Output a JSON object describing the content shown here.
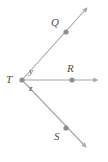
{
  "figure": {
    "type": "geometry-diagram",
    "background_color": "#ffffff",
    "line_color": "#a0a0a0",
    "point_color": "#8c8c8c",
    "label_color": "#4c4c4c",
    "vertex": {
      "name": "T",
      "label": "T",
      "x": 22,
      "y": 80
    },
    "rays": [
      {
        "name": "ray-TQ",
        "from": "T",
        "through": "Q",
        "x1": 22,
        "y1": 80,
        "x2": 88,
        "y2": 7,
        "end_marker": "arrowhead"
      },
      {
        "name": "ray-TR",
        "from": "T",
        "through": "R",
        "x1": 22,
        "y1": 80,
        "x2": 99,
        "y2": 80,
        "end_marker": "arrowhead"
      },
      {
        "name": "ray-TS",
        "from": "T",
        "through": "S",
        "x1": 22,
        "y1": 80,
        "x2": 87,
        "y2": 148,
        "end_marker": "arrowhead"
      }
    ],
    "points": [
      {
        "name": "Q",
        "label": "Q",
        "x": 66,
        "y": 32,
        "label_x": 51,
        "label_y": 17
      },
      {
        "name": "R",
        "label": "R",
        "x": 72,
        "y": 80,
        "label_x": 67,
        "label_y": 63
      },
      {
        "name": "S",
        "label": "S",
        "x": 66,
        "y": 128,
        "label_x": 54,
        "label_y": 131
      }
    ],
    "angles": [
      {
        "name": "angle-y",
        "label": "y",
        "between": "ray-TQ and ray-TR",
        "x": 29,
        "y": 67
      },
      {
        "name": "angle-z",
        "label": "z",
        "between": "ray-TR and ray-TS",
        "x": 29,
        "y": 84
      }
    ]
  }
}
